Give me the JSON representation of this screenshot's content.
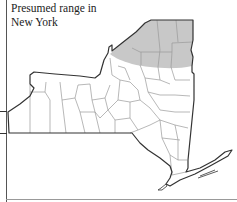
{
  "map": {
    "title_line1": "Presumed range in",
    "title_line2": "New York",
    "region": "New York State",
    "shaded_area": "Northern New York (Adirondack / North Country counties)",
    "colors": {
      "shaded": "#c8c8c8",
      "outline": "#333333",
      "county_lines": "#9a9a9a",
      "background": "#ffffff"
    }
  }
}
